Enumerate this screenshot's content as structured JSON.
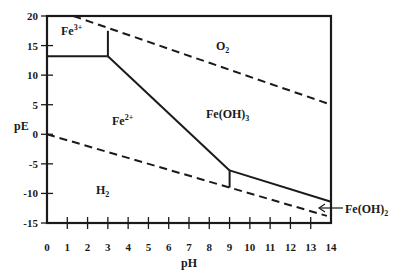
{
  "chart_data": {
    "type": "line",
    "title": "",
    "xlabel": "pH",
    "ylabel": "pE",
    "xlim": [
      0,
      14
    ],
    "ylim": [
      -15,
      20
    ],
    "grid": false,
    "x_ticks": [
      "0",
      "1",
      "2",
      "3",
      "4",
      "5",
      "6",
      "7",
      "8",
      "9",
      "10",
      "11",
      "12",
      "13",
      "14"
    ],
    "y_ticks": [
      "20",
      "15",
      "10",
      "5",
      "0",
      "-5",
      "-10",
      "-15"
    ],
    "series": [
      {
        "name": "O2/H2O boundary",
        "style": "dashed",
        "points": [
          [
            1.3,
            20
          ],
          [
            14,
            5
          ]
        ]
      },
      {
        "name": "H2O/H2 boundary",
        "style": "dashed",
        "points": [
          [
            0,
            0
          ],
          [
            13.8,
            -13.8
          ]
        ]
      },
      {
        "name": "Fe3+/Fe2+",
        "style": "solid",
        "points": [
          [
            0,
            13.2
          ],
          [
            3,
            13.2
          ]
        ]
      },
      {
        "name": "Fe3+/Fe(OH)3",
        "style": "solid",
        "points": [
          [
            3,
            13.2
          ],
          [
            3,
            17.5
          ]
        ]
      },
      {
        "name": "Fe2+/Fe(OH)3",
        "style": "solid",
        "points": [
          [
            3,
            13.2
          ],
          [
            9,
            -6.1
          ]
        ]
      },
      {
        "name": "Fe(OH)3/Fe(OH)2",
        "style": "solid",
        "points": [
          [
            9,
            -6.1
          ],
          [
            14,
            -11.4
          ]
        ]
      },
      {
        "name": "Fe2+/Fe(OH)2",
        "style": "solid",
        "points": [
          [
            9,
            -6.1
          ],
          [
            9,
            -9
          ]
        ]
      }
    ],
    "annotations": [
      {
        "text": "Fe3+",
        "base": "Fe",
        "sup": "3+",
        "pH": 0.8,
        "pE": 17.5
      },
      {
        "text": "O2",
        "base": "O",
        "sub": "2",
        "pH": 8.4,
        "pE": 15
      },
      {
        "text": "Fe2+",
        "base": "Fe",
        "sup": "2+",
        "pH": 3.2,
        "pE": 2
      },
      {
        "text": "Fe(OH)3",
        "base": "Fe(OH)",
        "sub": "3",
        "pH": 7.9,
        "pE": 3.4
      },
      {
        "text": "H2",
        "base": "H",
        "sub": "2",
        "pH": 2.3,
        "pE": -9.4
      },
      {
        "text": "Fe(OH)2",
        "base": "Fe(OH)",
        "sub": "2",
        "pH": 14.6,
        "pE": -12.7,
        "arrow_to_pH": 13.5
      }
    ]
  },
  "labels": {
    "xlabel": "pH",
    "ylabel": "pE",
    "fe3": {
      "base": "Fe",
      "sup": "3+"
    },
    "o2": {
      "base": "O",
      "sub": "2"
    },
    "fe2": {
      "base": "Fe",
      "sup": "2+"
    },
    "feoh3": {
      "base": "Fe(OH)",
      "sub": "3"
    },
    "h2": {
      "base": "H",
      "sub": "2"
    },
    "feoh2": {
      "base": "Fe(OH)",
      "sub": "2"
    }
  },
  "colors": {
    "line": "#1a1a1a",
    "background": "#ffffff"
  }
}
